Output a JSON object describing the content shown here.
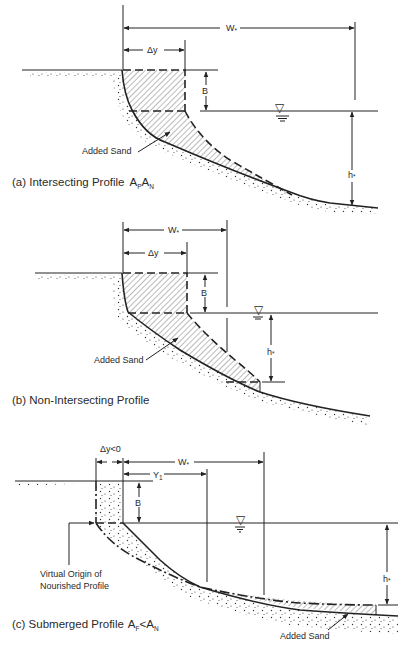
{
  "figure": {
    "panel_a": {
      "caption": "(a) Intersecting Profile",
      "caption_math_1": "A",
      "caption_math_1_sub": "P",
      "caption_math_2": "A",
      "caption_math_2_sub": "N",
      "label_W": "W",
      "label_W_sub": "*",
      "label_dy": "Δy",
      "label_B": "B",
      "label_h": "h",
      "label_h_sub": "*",
      "label_added_sand": "Added Sand"
    },
    "panel_b": {
      "caption": "(b) Non-Intersecting Profile",
      "label_W": "W",
      "label_W_sub": "*",
      "label_dy": "Δy",
      "label_B": "B",
      "label_h": "h",
      "label_h_sub": "*",
      "label_added_sand": "Added Sand"
    },
    "panel_c": {
      "caption": "(c)  Submerged Profile",
      "caption_math_1": "A",
      "caption_math_1_sub": "F",
      "caption_relation": "<",
      "caption_math_2": "A",
      "caption_math_2_sub": "N",
      "label_dy": "Δy<0",
      "label_W": "W",
      "label_W_sub": "*",
      "label_Y": "Y",
      "label_Y_sub": "1",
      "label_B": "B",
      "label_h": "h",
      "label_h_sub": "*",
      "label_virtual_origin_1": "Virtual Origin of",
      "label_virtual_origin_2": "Nourished Profile",
      "label_added_sand": "Added Sand"
    },
    "water_level_symbol": "▽"
  }
}
